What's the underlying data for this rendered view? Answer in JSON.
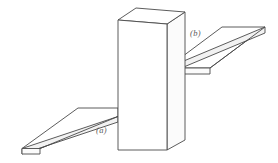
{
  "figure": {
    "background_color": "#ffffff",
    "line_color": "#4a4a4a",
    "label_color": "#5a5a5a",
    "objects": {
      "column": {
        "name": "vertical rectangular box",
        "front_face": "118,20 167,24 167,150 118,150",
        "top_face": "118,20 136,8 185,12 167,24",
        "right_face": "167,24 185,12 185,140 167,150"
      },
      "board_a": {
        "name": "lower-left flat board",
        "label": "(a)",
        "label_x": 96,
        "label_y": 133,
        "top_face": "78,108 118,108 118,116 40,148 22,148",
        "front_edge": "22,148 118,116 118,122 22,154",
        "end_face": "22,148 22,154 40,154 40,148"
      },
      "board_b": {
        "name": "upper-right flat board",
        "label": "(b)",
        "label_x": 190,
        "label_y": 36,
        "top_face": "167,68 210,68 265,27 222,27",
        "front_edge": "167,68 167,74 265,33 265,27",
        "end_face": "210,68 210,74 167,74 167,68"
      }
    },
    "labels": [
      {
        "id": "label-a",
        "text": "(a)"
      },
      {
        "id": "label-b",
        "text": "(b)"
      }
    ]
  }
}
